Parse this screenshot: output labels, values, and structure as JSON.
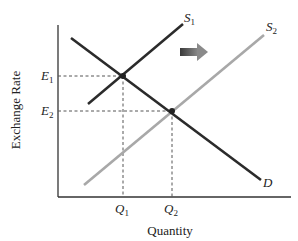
{
  "diagram": {
    "type": "supply-demand",
    "y_axis_label": "Exchange Rate",
    "x_axis_label": "Quantity",
    "curves": {
      "s1": {
        "label": "S",
        "sub": "1",
        "color": "#2b2b2b"
      },
      "s2": {
        "label": "S",
        "sub": "2",
        "color": "#a8a8a8"
      },
      "d": {
        "label": "D",
        "color": "#2b2b2b"
      }
    },
    "y_ticks": [
      {
        "label": "E",
        "sub": "1"
      },
      {
        "label": "E",
        "sub": "2"
      }
    ],
    "x_ticks": [
      {
        "label": "Q",
        "sub": "1"
      },
      {
        "label": "Q",
        "sub": "2"
      }
    ],
    "shift_arrow": {
      "direction": "right",
      "color": "#555555"
    }
  }
}
